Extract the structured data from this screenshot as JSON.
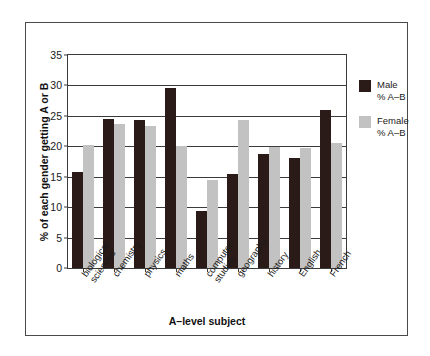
{
  "chart_data": {
    "type": "bar",
    "title": "",
    "xlabel": "A–level subject",
    "ylabel": "% of each gender getting A or B",
    "ylim": [
      0,
      35
    ],
    "yticks": [
      0,
      5,
      10,
      15,
      20,
      25,
      30,
      35
    ],
    "grid": true,
    "legend_position": "right",
    "categories": [
      "biological sciences",
      "chemistry",
      "physics",
      "maths",
      "computer studies",
      "geography",
      "history",
      "English",
      "French"
    ],
    "category_lines": [
      [
        "biological",
        "sciences"
      ],
      [
        "chemistry",
        ""
      ],
      [
        "physics",
        ""
      ],
      [
        "maths",
        ""
      ],
      [
        "computer",
        "studies"
      ],
      [
        "geography",
        ""
      ],
      [
        "history",
        ""
      ],
      [
        "English",
        ""
      ],
      [
        "French",
        ""
      ]
    ],
    "series": [
      {
        "name": "Male % A–B",
        "name_lines": [
          "Male",
          "% A–B"
        ],
        "color": "#2a1a18",
        "values": [
          15.7,
          24.5,
          24.4,
          29.5,
          9.4,
          15.4,
          18.7,
          18.0,
          26.0
        ]
      },
      {
        "name": "Female % A–B",
        "name_lines": [
          "Female",
          "% A–B"
        ],
        "color": "#c2c2c2",
        "values": [
          20.2,
          23.6,
          23.4,
          20.0,
          14.4,
          24.4,
          19.9,
          19.7,
          20.6
        ]
      }
    ]
  },
  "colors": {
    "male": "#2a1a18",
    "female": "#c2c2c2",
    "axis": "#3b3b3b",
    "frame": "#4a4a4a",
    "background": "#ffffff"
  }
}
